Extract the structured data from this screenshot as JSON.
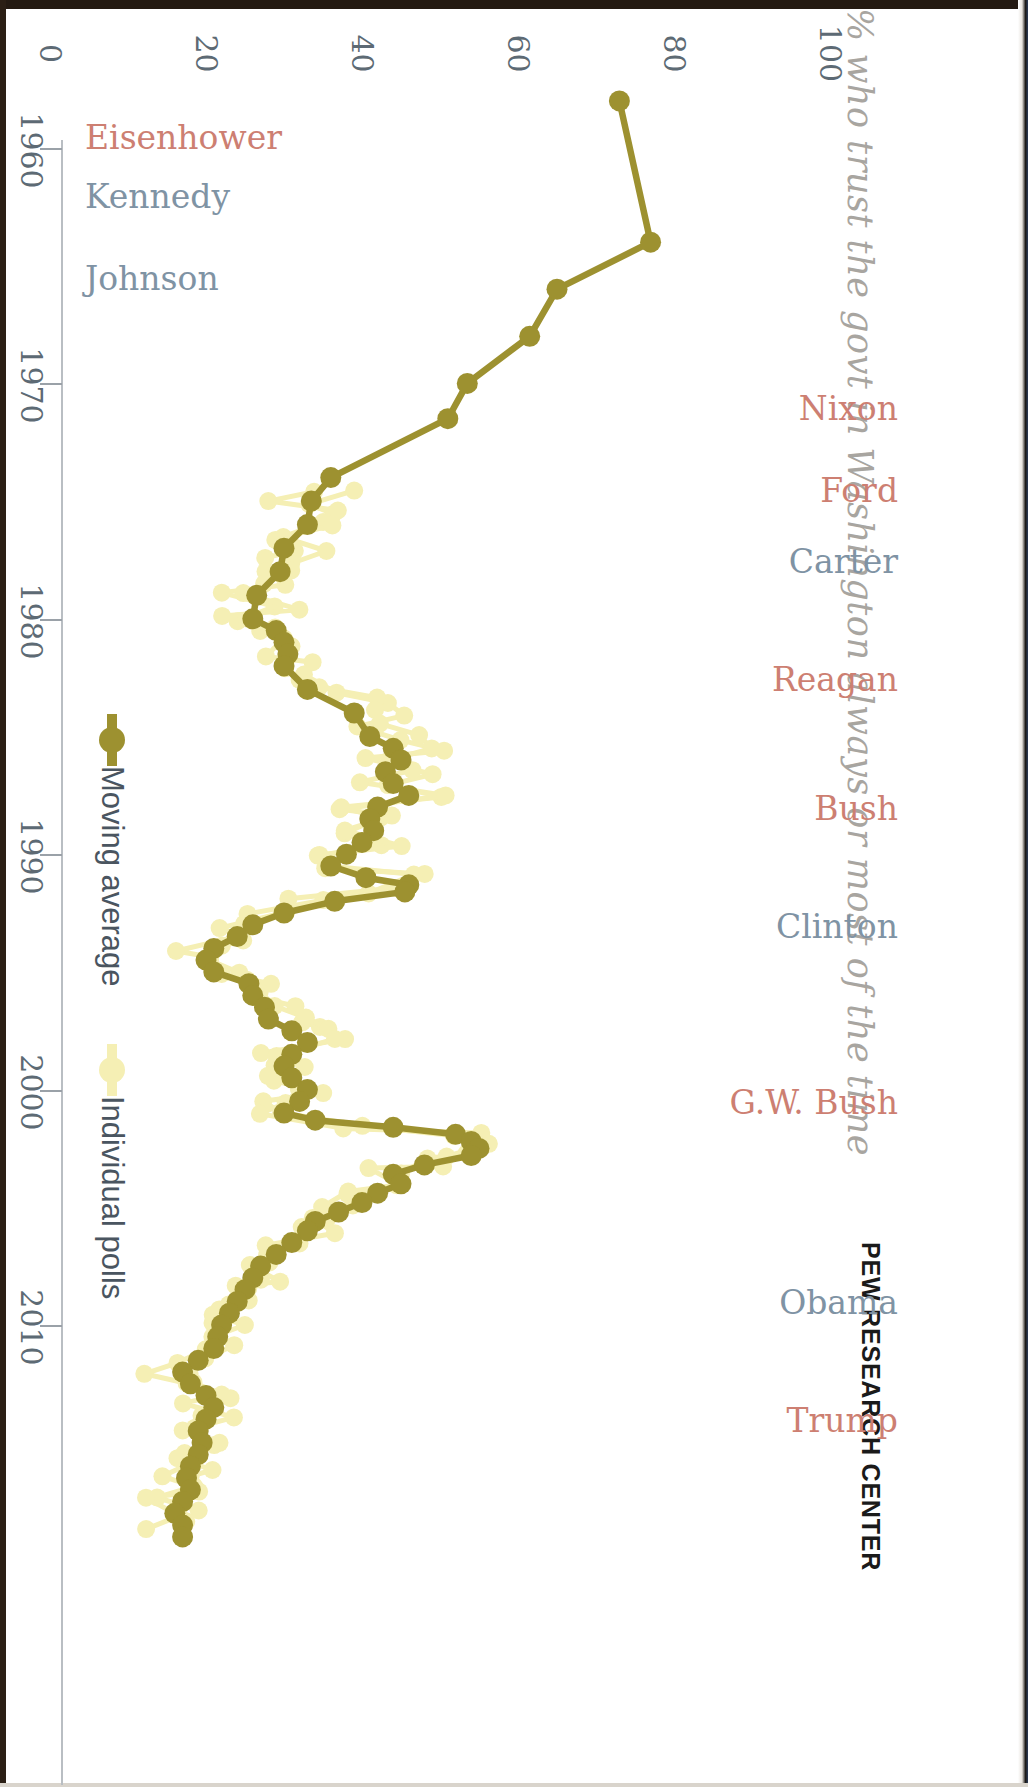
{
  "title": "% who trust the govt in Washington always or most of the time",
  "attribution": "PEW RESEARCH CENTER",
  "colors": {
    "moving_average": "#9d9130",
    "individual_polls": "#f5efb4",
    "republican_label": "#cd7f72",
    "democrat_label": "#7f93a4",
    "axis_text": "#5d6a74",
    "title_text": "#a8a5a0"
  },
  "legend": {
    "items": [
      {
        "label": "Moving average",
        "color": "#9d9130",
        "marker": "line-dot"
      },
      {
        "label": "Individual polls",
        "color": "#f5efb4",
        "marker": "dot"
      }
    ]
  },
  "value_axis": {
    "label": "",
    "ticks": [
      "0",
      "20",
      "40",
      "60",
      "80",
      "100"
    ],
    "min": 0,
    "max": 100
  },
  "year_axis": {
    "ticks": [
      "1960",
      "1970",
      "1980",
      "1990",
      "2000",
      "2010"
    ],
    "min": 1958,
    "max": 2019
  },
  "presidents": [
    {
      "name": "Eisenhower",
      "party": "rep",
      "year": 1959.5
    },
    {
      "name": "Kennedy",
      "party": "dem",
      "year": 1962.0
    },
    {
      "name": "Johnson",
      "party": "dem",
      "year": 1965.5
    },
    {
      "name": "Nixon",
      "party": "rep",
      "year": 1971.0
    },
    {
      "name": "Ford",
      "party": "rep",
      "year": 1974.5
    },
    {
      "name": "Carter",
      "party": "dem",
      "year": 1977.5
    },
    {
      "name": "Reagan",
      "party": "rep",
      "year": 1982.5
    },
    {
      "name": "Bush",
      "party": "rep",
      "year": 1988.0
    },
    {
      "name": "Clinton",
      "party": "dem",
      "year": 1993.0
    },
    {
      "name": "G.W. Bush",
      "party": "rep",
      "year": 2000.5
    },
    {
      "name": "Obama",
      "party": "dem",
      "year": 2009.0
    },
    {
      "name": "Trump",
      "party": "rep",
      "year": 2014.0
    }
  ],
  "chart_data": {
    "type": "line",
    "title": "% who trust the govt in Washington always or most of the time",
    "xlabel": "",
    "ylabel": "",
    "orientation": "vertical-time-axis",
    "xlim": [
      1958,
      2019
    ],
    "ylim": [
      0,
      100
    ],
    "grid": false,
    "legend_position": "left-inside",
    "series": [
      {
        "name": "Moving average",
        "color": "#9d9130",
        "points": [
          [
            1958.0,
            73.0
          ],
          [
            1964.0,
            77.0
          ],
          [
            1966.0,
            65.0
          ],
          [
            1968.0,
            61.5
          ],
          [
            1970.0,
            53.5
          ],
          [
            1971.5,
            51.0
          ],
          [
            1974.0,
            36.0
          ],
          [
            1975.0,
            33.5
          ],
          [
            1976.0,
            33.0
          ],
          [
            1977.0,
            30.0
          ],
          [
            1978.0,
            29.5
          ],
          [
            1979.0,
            26.5
          ],
          [
            1980.0,
            26.0
          ],
          [
            1980.5,
            29.0
          ],
          [
            1981.0,
            30.0
          ],
          [
            1981.5,
            30.5
          ],
          [
            1982.0,
            30.0
          ],
          [
            1983.0,
            33.0
          ],
          [
            1984.0,
            39.0
          ],
          [
            1985.0,
            41.0
          ],
          [
            1985.5,
            44.0
          ],
          [
            1986.0,
            45.0
          ],
          [
            1986.5,
            43.0
          ],
          [
            1987.0,
            44.0
          ],
          [
            1987.5,
            46.0
          ],
          [
            1988.0,
            42.0
          ],
          [
            1988.5,
            41.0
          ],
          [
            1989.0,
            41.5
          ],
          [
            1989.5,
            40.0
          ],
          [
            1990.0,
            38.0
          ],
          [
            1990.5,
            36.0
          ],
          [
            1991.0,
            40.5
          ],
          [
            1991.3,
            46.0
          ],
          [
            1991.6,
            45.5
          ],
          [
            1992.0,
            36.5
          ],
          [
            1992.5,
            30.0
          ],
          [
            1993.0,
            26.0
          ],
          [
            1993.5,
            24.0
          ],
          [
            1994.0,
            21.0
          ],
          [
            1994.5,
            20.0
          ],
          [
            1995.0,
            21.0
          ],
          [
            1995.5,
            25.5
          ],
          [
            1996.0,
            26.0
          ],
          [
            1996.5,
            27.5
          ],
          [
            1997.0,
            28.0
          ],
          [
            1997.5,
            31.0
          ],
          [
            1998.0,
            33.0
          ],
          [
            1998.5,
            31.0
          ],
          [
            1999.0,
            30.0
          ],
          [
            1999.5,
            31.0
          ],
          [
            2000.0,
            33.0
          ],
          [
            2000.5,
            32.0
          ],
          [
            2001.0,
            30.0
          ],
          [
            2001.3,
            34.0
          ],
          [
            2001.6,
            44.0
          ],
          [
            2001.9,
            52.0
          ],
          [
            2002.2,
            54.0
          ],
          [
            2002.5,
            55.0
          ],
          [
            2002.8,
            54.0
          ],
          [
            2003.2,
            48.0
          ],
          [
            2003.6,
            44.0
          ],
          [
            2004.0,
            45.0
          ],
          [
            2004.4,
            42.0
          ],
          [
            2004.8,
            40.0
          ],
          [
            2005.2,
            37.0
          ],
          [
            2005.6,
            34.0
          ],
          [
            2006.0,
            33.0
          ],
          [
            2006.5,
            31.0
          ],
          [
            2007.0,
            29.0
          ],
          [
            2007.5,
            27.0
          ],
          [
            2008.0,
            26.0
          ],
          [
            2008.5,
            25.0
          ],
          [
            2009.0,
            24.0
          ],
          [
            2009.5,
            23.0
          ],
          [
            2010.0,
            22.0
          ],
          [
            2010.5,
            21.5
          ],
          [
            2011.0,
            21.0
          ],
          [
            2011.5,
            19.0
          ],
          [
            2012.0,
            17.0
          ],
          [
            2012.5,
            18.0
          ],
          [
            2013.0,
            20.0
          ],
          [
            2013.5,
            21.0
          ],
          [
            2014.0,
            20.0
          ],
          [
            2014.5,
            19.0
          ],
          [
            2015.0,
            19.5
          ],
          [
            2015.5,
            19.0
          ],
          [
            2016.0,
            18.0
          ],
          [
            2016.5,
            17.5
          ],
          [
            2017.0,
            18.0
          ],
          [
            2017.5,
            17.0
          ],
          [
            2018.0,
            16.0
          ],
          [
            2018.5,
            17.0
          ],
          [
            2019.0,
            17.0
          ]
        ]
      },
      {
        "name": "Individual polls",
        "color": "#f5efb4",
        "points": [
          [
            1974.5,
            36.0
          ],
          [
            1975.0,
            31.0
          ],
          [
            1975.5,
            39.0
          ],
          [
            1976.0,
            33.0
          ],
          [
            1976.5,
            30.0
          ],
          [
            1977.0,
            34.0
          ],
          [
            1977.5,
            28.0
          ],
          [
            1978.0,
            30.0
          ],
          [
            1978.5,
            28.0
          ],
          [
            1979.0,
            25.0
          ],
          [
            1979.5,
            29.0
          ],
          [
            1980.0,
            25.0
          ],
          [
            1980.5,
            28.0
          ],
          [
            1981.0,
            32.0
          ],
          [
            1981.5,
            29.0
          ],
          [
            1982.0,
            33.0
          ],
          [
            1982.5,
            31.0
          ],
          [
            1983.0,
            37.0
          ],
          [
            1983.5,
            41.0
          ],
          [
            1984.0,
            44.0
          ],
          [
            1984.5,
            42.0
          ],
          [
            1985.0,
            46.0
          ],
          [
            1985.5,
            48.0
          ],
          [
            1986.0,
            42.0
          ],
          [
            1986.5,
            47.0
          ],
          [
            1987.0,
            41.0
          ],
          [
            1987.5,
            48.0
          ],
          [
            1988.0,
            40.0
          ],
          [
            1988.5,
            44.0
          ],
          [
            1989.0,
            39.0
          ],
          [
            1989.5,
            43.0
          ],
          [
            1990.0,
            35.0
          ],
          [
            1990.5,
            34.0
          ],
          [
            1991.0,
            47.0
          ],
          [
            1991.5,
            44.0
          ],
          [
            1992.0,
            33.0
          ],
          [
            1992.5,
            28.0
          ],
          [
            1993.0,
            24.0
          ],
          [
            1993.5,
            22.0
          ],
          [
            1994.0,
            19.0
          ],
          [
            1994.5,
            18.0
          ],
          [
            1995.0,
            22.0
          ],
          [
            1995.5,
            27.0
          ],
          [
            1996.0,
            24.0
          ],
          [
            1996.5,
            29.0
          ],
          [
            1997.0,
            31.0
          ],
          [
            1997.5,
            33.0
          ],
          [
            1998.0,
            35.0
          ],
          [
            1998.5,
            29.0
          ],
          [
            1999.0,
            32.0
          ],
          [
            1999.5,
            28.0
          ],
          [
            2000.0,
            35.0
          ],
          [
            2000.5,
            30.0
          ],
          [
            2001.0,
            28.0
          ],
          [
            2001.5,
            40.0
          ],
          [
            2001.9,
            55.0
          ],
          [
            2002.3,
            57.0
          ],
          [
            2002.7,
            53.0
          ],
          [
            2003.1,
            49.0
          ],
          [
            2003.5,
            42.0
          ],
          [
            2004.0,
            47.0
          ],
          [
            2004.5,
            41.0
          ],
          [
            2005.0,
            38.0
          ],
          [
            2005.5,
            33.0
          ],
          [
            2006.0,
            35.0
          ],
          [
            2006.5,
            30.0
          ],
          [
            2007.0,
            31.0
          ],
          [
            2007.5,
            26.0
          ],
          [
            2008.0,
            28.0
          ],
          [
            2008.5,
            24.0
          ],
          [
            2009.0,
            26.0
          ],
          [
            2009.5,
            22.0
          ],
          [
            2010.0,
            24.0
          ],
          [
            2010.5,
            19.0
          ],
          [
            2011.0,
            23.0
          ],
          [
            2011.5,
            17.0
          ],
          [
            2012.0,
            15.0
          ],
          [
            2012.5,
            20.0
          ],
          [
            2013.0,
            22.0
          ],
          [
            2013.5,
            19.0
          ],
          [
            2014.0,
            22.0
          ],
          [
            2014.5,
            17.0
          ],
          [
            2015.0,
            21.0
          ],
          [
            2015.5,
            18.0
          ],
          [
            2016.0,
            19.0
          ],
          [
            2016.5,
            16.0
          ],
          [
            2017.0,
            20.0
          ],
          [
            2017.5,
            15.0
          ],
          [
            2018.0,
            18.0
          ],
          [
            2018.5,
            15.0
          ]
        ]
      }
    ]
  }
}
